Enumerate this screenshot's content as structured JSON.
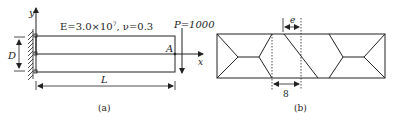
{
  "panel_a": {
    "caption": "(a)",
    "material_label": "E=3.0×10",
    "material_exp": "7",
    "poisson_label": ",  ν=0.3",
    "load_label": "P=1000",
    "point_label": "A",
    "depth_label": "D",
    "length_label": "L",
    "axis_x": "x",
    "axis_y": "y"
  },
  "panel_b": {
    "caption": "(b)",
    "distortion_label": "e",
    "spacing_label": "8"
  },
  "colors": {
    "line": "#222222",
    "background": "#ffffff"
  }
}
